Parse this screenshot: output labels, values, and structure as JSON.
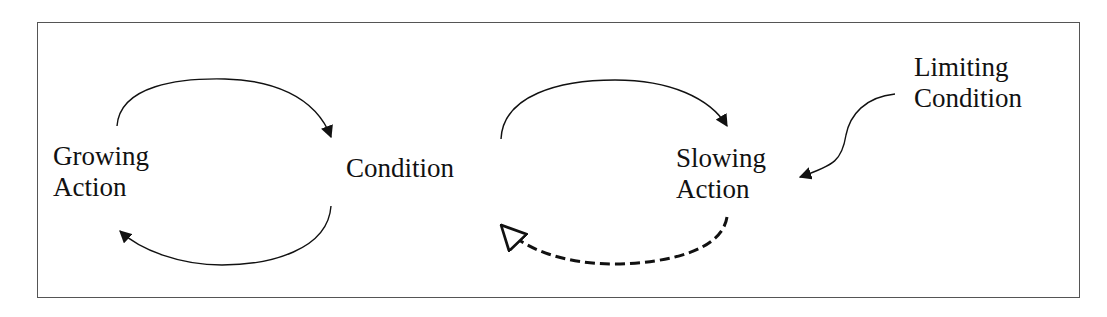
{
  "diagram": {
    "type": "causal-loop",
    "nodes": {
      "growing_action": {
        "line1": "Growing",
        "line2": "Action"
      },
      "condition": {
        "line1": "Condition"
      },
      "slowing_action": {
        "line1": "Slowing",
        "line2": "Action"
      },
      "limiting_condition": {
        "line1": "Limiting",
        "line2": "Condition"
      }
    },
    "edges": [
      {
        "from": "Growing Action",
        "to": "Condition",
        "style": "solid",
        "head": "filled"
      },
      {
        "from": "Condition",
        "to": "Growing Action",
        "style": "solid",
        "head": "filled"
      },
      {
        "from": "Condition",
        "to": "Slowing Action",
        "style": "solid",
        "head": "filled"
      },
      {
        "from": "Slowing Action",
        "to": "Condition",
        "style": "dashed",
        "head": "hollow"
      },
      {
        "from": "Limiting Condition",
        "to": "Slowing Action",
        "style": "solid",
        "head": "filled"
      }
    ],
    "colors": {
      "stroke": "#111111",
      "frame": "#555555",
      "background": "#ffffff"
    }
  }
}
